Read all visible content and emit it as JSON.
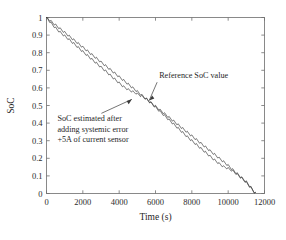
{
  "chart_data": {
    "type": "line",
    "title": "",
    "xlabel": "Time (s)",
    "ylabel": "SoC",
    "xlim": [
      0,
      12000
    ],
    "ylim": [
      0,
      1
    ],
    "grid": false,
    "legend_position": "none",
    "xticks": [
      0,
      2000,
      4000,
      6000,
      8000,
      10000,
      12000
    ],
    "xtick_labels": [
      "0",
      "2000",
      "4000",
      "6000",
      "8000",
      "10000",
      "12000"
    ],
    "yticks": [
      0,
      0.1,
      0.2,
      0.3,
      0.4,
      0.5,
      0.6,
      0.7,
      0.8,
      0.9,
      1
    ],
    "ytick_labels": [
      "0",
      "0.1",
      "0.2",
      "0.3",
      "0.4",
      "0.5",
      "0.6",
      "0.7",
      "0.8",
      "0.9",
      "1"
    ],
    "series": [
      {
        "name": "Reference SoC value",
        "color": "#3a3a3a",
        "x": [
          0,
          250,
          500,
          750,
          1000,
          1250,
          1500,
          1750,
          2000,
          2250,
          2500,
          2750,
          3000,
          3250,
          3500,
          3750,
          4000,
          4250,
          4500,
          4750,
          5000,
          5250,
          5500,
          5750,
          6000,
          6250,
          6500,
          6750,
          7000,
          7250,
          7500,
          7750,
          8000,
          8250,
          8500,
          8750,
          9000,
          9250,
          9500,
          9750,
          10000,
          10250,
          10500,
          10750,
          11000,
          11250,
          11500
        ],
        "y": [
          1.0,
          0.978,
          0.957,
          0.936,
          0.915,
          0.894,
          0.873,
          0.852,
          0.831,
          0.81,
          0.789,
          0.768,
          0.747,
          0.726,
          0.705,
          0.684,
          0.663,
          0.642,
          0.621,
          0.6,
          0.579,
          0.558,
          0.537,
          0.516,
          0.495,
          0.474,
          0.453,
          0.432,
          0.411,
          0.39,
          0.369,
          0.348,
          0.327,
          0.306,
          0.285,
          0.264,
          0.243,
          0.222,
          0.201,
          0.18,
          0.159,
          0.135,
          0.112,
          0.089,
          0.066,
          0.035,
          0.0
        ]
      },
      {
        "name": "SoC estimated after adding systemic error +5A of current sensor",
        "color": "#3a3a3a",
        "x": [
          0,
          250,
          500,
          750,
          1000,
          1250,
          1500,
          1750,
          2000,
          2250,
          2500,
          2750,
          3000,
          3250,
          3500,
          3750,
          4000,
          4250,
          4500,
          4750,
          5000,
          5250,
          5500,
          5750,
          6000,
          6250,
          6500,
          6750,
          7000,
          7250,
          7500,
          7750,
          8000,
          8250,
          8500,
          8750,
          9000,
          9250,
          9500,
          9750,
          10000,
          10250,
          10500,
          10750,
          11000,
          11250,
          11500
        ],
        "y": [
          1.0,
          0.968,
          0.94,
          0.916,
          0.895,
          0.874,
          0.852,
          0.829,
          0.806,
          0.784,
          0.762,
          0.74,
          0.718,
          0.696,
          0.673,
          0.65,
          0.628,
          0.606,
          0.59,
          0.578,
          0.566,
          0.552,
          0.536,
          0.514,
          0.49,
          0.466,
          0.442,
          0.418,
          0.394,
          0.37,
          0.346,
          0.322,
          0.3,
          0.278,
          0.256,
          0.234,
          0.212,
          0.19,
          0.17,
          0.152,
          0.142,
          0.128,
          0.108,
          0.086,
          0.062,
          0.032,
          0.0
        ]
      }
    ],
    "ripple": {
      "description": "sawtooth staircase ripple superimposed on both discharge curves",
      "period_s": 250,
      "amplitude": 0.012
    },
    "annotations": [
      {
        "id": "reference-soc-annotation",
        "text": "Reference SoC value",
        "text_x": 6200,
        "text_y": 0.655,
        "arrow_to_x": 5650,
        "arrow_to_y": 0.528
      },
      {
        "id": "estimated-soc-annotation",
        "lines": [
          "SoC estimated after",
          "adding systemic error",
          "+5A of current sensor"
        ],
        "text_x": 600,
        "text_y": 0.41,
        "arrow_to_x": 4700,
        "arrow_to_y": 0.535
      }
    ]
  }
}
